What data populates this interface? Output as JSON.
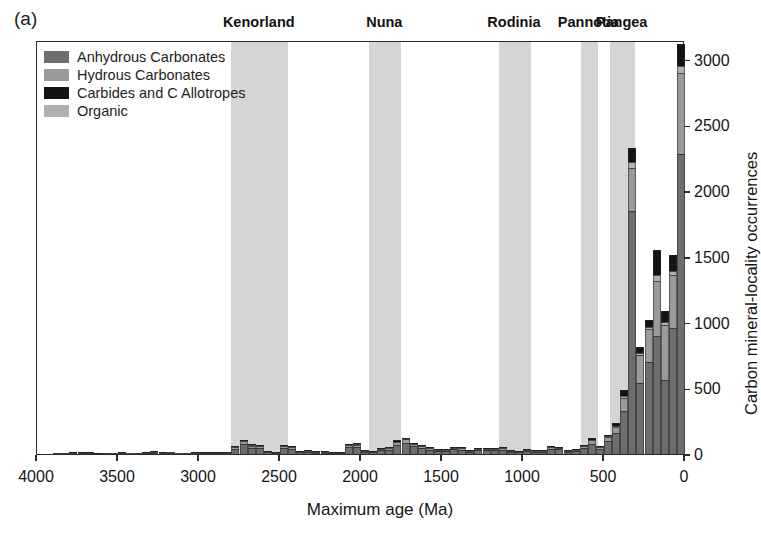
{
  "panel": {
    "label": "(a)"
  },
  "legend": {
    "items": [
      {
        "label": "Anhydrous Carbonates",
        "color": "#6e6e6e"
      },
      {
        "label": "Hydrous Carbonates",
        "color": "#9a9a9a"
      },
      {
        "label": "Carbides and C Allotropes",
        "color": "#141414"
      },
      {
        "label": "Organic",
        "color": "#b0b0b0"
      }
    ]
  },
  "supercontinents": [
    {
      "name": "Kenorland",
      "start": 2800,
      "end": 2450
    },
    {
      "name": "Nuna",
      "start": 1950,
      "end": 1750
    },
    {
      "name": "Rodinia",
      "start": 1150,
      "end": 950
    },
    {
      "name": "Pannotia",
      "start": 640,
      "end": 540
    },
    {
      "name": "Pangea",
      "start": 460,
      "end": 310
    }
  ],
  "chart_data": {
    "type": "bar",
    "title": "",
    "subtitle": "",
    "stacked": true,
    "xlabel": "Maximum age (Ma)",
    "ylabel": "Carbon mineral-locality occurrences",
    "xlim": [
      4000,
      0
    ],
    "ylim": [
      0,
      3150
    ],
    "x_reversed": true,
    "xticks": [
      4000,
      3500,
      3000,
      2500,
      2000,
      1500,
      1000,
      500,
      0
    ],
    "yticks": [
      0,
      500,
      1000,
      1500,
      2000,
      2500,
      3000
    ],
    "grid": false,
    "legend_position": "top-left",
    "bin_width": 50,
    "series": [
      {
        "name": "Anhydrous Carbonates",
        "color": "#6e6e6e"
      },
      {
        "name": "Hydrous Carbonates",
        "color": "#9a9a9a"
      },
      {
        "name": "Carbides and C Allotropes",
        "color": "#141414"
      },
      {
        "name": "Organic",
        "color": "#b0b0b0"
      }
    ],
    "bins": [
      {
        "age": 4000,
        "values": [
          0,
          0,
          0,
          0
        ]
      },
      {
        "age": 3950,
        "values": [
          0,
          0,
          0,
          0
        ]
      },
      {
        "age": 3900,
        "values": [
          0,
          0,
          0,
          0
        ]
      },
      {
        "age": 3850,
        "values": [
          2,
          0,
          0,
          0
        ]
      },
      {
        "age": 3800,
        "values": [
          2,
          0,
          0,
          0
        ]
      },
      {
        "age": 3750,
        "values": [
          4,
          0,
          1,
          0
        ]
      },
      {
        "age": 3700,
        "values": [
          8,
          1,
          2,
          0
        ]
      },
      {
        "age": 3650,
        "values": [
          5,
          1,
          1,
          0
        ]
      },
      {
        "age": 3600,
        "values": [
          3,
          0,
          1,
          0
        ]
      },
      {
        "age": 3550,
        "values": [
          2,
          0,
          0,
          0
        ]
      },
      {
        "age": 3500,
        "values": [
          3,
          1,
          0,
          0
        ]
      },
      {
        "age": 3450,
        "values": [
          4,
          1,
          1,
          0
        ]
      },
      {
        "age": 3400,
        "values": [
          3,
          1,
          0,
          0
        ]
      },
      {
        "age": 3350,
        "values": [
          3,
          0,
          0,
          0
        ]
      },
      {
        "age": 3300,
        "values": [
          6,
          1,
          1,
          0
        ]
      },
      {
        "age": 3250,
        "values": [
          10,
          2,
          2,
          0
        ]
      },
      {
        "age": 3200,
        "values": [
          7,
          2,
          1,
          0
        ]
      },
      {
        "age": 3150,
        "values": [
          4,
          1,
          0,
          0
        ]
      },
      {
        "age": 3100,
        "values": [
          3,
          1,
          0,
          0
        ]
      },
      {
        "age": 3050,
        "values": [
          3,
          0,
          0,
          0
        ]
      },
      {
        "age": 3000,
        "values": [
          5,
          1,
          1,
          0
        ]
      },
      {
        "age": 2950,
        "values": [
          4,
          1,
          1,
          0
        ]
      },
      {
        "age": 2900,
        "values": [
          5,
          1,
          1,
          0
        ]
      },
      {
        "age": 2850,
        "values": [
          6,
          2,
          1,
          0
        ]
      },
      {
        "age": 2800,
        "values": [
          8,
          2,
          2,
          0
        ]
      },
      {
        "age": 2750,
        "values": [
          40,
          12,
          6,
          2
        ]
      },
      {
        "age": 2700,
        "values": [
          75,
          22,
          10,
          3
        ]
      },
      {
        "age": 2650,
        "values": [
          48,
          16,
          7,
          2
        ]
      },
      {
        "age": 2600,
        "values": [
          44,
          14,
          6,
          2
        ]
      },
      {
        "age": 2550,
        "values": [
          12,
          4,
          2,
          0
        ]
      },
      {
        "age": 2500,
        "values": [
          8,
          3,
          1,
          0
        ]
      },
      {
        "age": 2450,
        "values": [
          45,
          14,
          6,
          2
        ]
      },
      {
        "age": 2400,
        "values": [
          40,
          12,
          5,
          2
        ]
      },
      {
        "age": 2350,
        "values": [
          14,
          4,
          2,
          0
        ]
      },
      {
        "age": 2300,
        "values": [
          16,
          5,
          2,
          1
        ]
      },
      {
        "age": 2250,
        "values": [
          10,
          3,
          1,
          0
        ]
      },
      {
        "age": 2200,
        "values": [
          9,
          3,
          1,
          0
        ]
      },
      {
        "age": 2150,
        "values": [
          6,
          2,
          1,
          0
        ]
      },
      {
        "age": 2100,
        "values": [
          5,
          2,
          1,
          0
        ]
      },
      {
        "age": 2050,
        "values": [
          52,
          16,
          7,
          2
        ]
      },
      {
        "age": 2000,
        "values": [
          55,
          17,
          8,
          2
        ]
      },
      {
        "age": 1950,
        "values": [
          16,
          5,
          2,
          1
        ]
      },
      {
        "age": 1900,
        "values": [
          14,
          4,
          2,
          0
        ]
      },
      {
        "age": 1850,
        "values": [
          30,
          9,
          4,
          1
        ]
      },
      {
        "age": 1800,
        "values": [
          32,
          10,
          4,
          1
        ]
      },
      {
        "age": 1750,
        "values": [
          70,
          22,
          10,
          3
        ]
      },
      {
        "age": 1700,
        "values": [
          85,
          26,
          11,
          3
        ]
      },
      {
        "age": 1650,
        "values": [
          58,
          18,
          8,
          2
        ]
      },
      {
        "age": 1600,
        "values": [
          46,
          14,
          6,
          2
        ]
      },
      {
        "age": 1550,
        "values": [
          34,
          10,
          4,
          1
        ]
      },
      {
        "age": 1500,
        "values": [
          22,
          7,
          3,
          1
        ]
      },
      {
        "age": 1450,
        "values": [
          20,
          6,
          3,
          1
        ]
      },
      {
        "age": 1400,
        "values": [
          36,
          11,
          5,
          1
        ]
      },
      {
        "age": 1350,
        "values": [
          34,
          10,
          4,
          1
        ]
      },
      {
        "age": 1300,
        "values": [
          18,
          5,
          2,
          1
        ]
      },
      {
        "age": 1250,
        "values": [
          30,
          9,
          4,
          1
        ]
      },
      {
        "age": 1200,
        "values": [
          28,
          9,
          4,
          1
        ]
      },
      {
        "age": 1150,
        "values": [
          30,
          9,
          4,
          1
        ]
      },
      {
        "age": 1100,
        "values": [
          32,
          10,
          4,
          1
        ]
      },
      {
        "age": 1050,
        "values": [
          18,
          5,
          2,
          1
        ]
      },
      {
        "age": 1000,
        "values": [
          12,
          4,
          2,
          0
        ]
      },
      {
        "age": 950,
        "values": [
          22,
          7,
          3,
          1
        ]
      },
      {
        "age": 900,
        "values": [
          16,
          5,
          2,
          1
        ]
      },
      {
        "age": 850,
        "values": [
          18,
          5,
          2,
          1
        ]
      },
      {
        "age": 800,
        "values": [
          38,
          12,
          5,
          1
        ]
      },
      {
        "age": 750,
        "values": [
          36,
          11,
          5,
          1
        ]
      },
      {
        "age": 700,
        "values": [
          18,
          5,
          2,
          1
        ]
      },
      {
        "age": 650,
        "values": [
          20,
          6,
          3,
          1
        ]
      },
      {
        "age": 600,
        "values": [
          46,
          14,
          6,
          2
        ]
      },
      {
        "age": 550,
        "values": [
          80,
          25,
          11,
          3
        ]
      },
      {
        "age": 500,
        "values": [
          38,
          12,
          5,
          2
        ]
      },
      {
        "age": 450,
        "values": [
          100,
          30,
          13,
          4
        ]
      },
      {
        "age": 400,
        "values": [
          160,
          48,
          20,
          6
        ]
      },
      {
        "age": 350,
        "values": [
          330,
          100,
          42,
          12
        ]
      },
      {
        "age": 300,
        "values": [
          1850,
          330,
          110,
          40
        ]
      },
      {
        "age": 250,
        "values": [
          540,
          210,
          50,
          15
        ]
      },
      {
        "age": 200,
        "values": [
          700,
          250,
          55,
          18
        ]
      },
      {
        "age": 150,
        "values": [
          900,
          420,
          190,
          40
        ]
      },
      {
        "age": 100,
        "values": [
          560,
          420,
          80,
          25
        ]
      },
      {
        "age": 50,
        "values": [
          960,
          400,
          120,
          35
        ]
      },
      {
        "age": 0,
        "values": [
          2280,
          620,
          170,
          50
        ]
      }
    ]
  }
}
